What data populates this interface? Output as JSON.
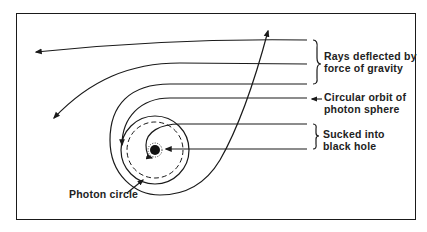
{
  "labels": {
    "rays_deflected_line1": "Rays deflected by",
    "rays_deflected_line2": "force of gravity",
    "circular_orbit_line1": "Circular orbit of",
    "circular_orbit_line2": "photon sphere",
    "sucked_line1": "Sucked into",
    "sucked_line2": "black hole",
    "photon_circle": "Photon circle"
  },
  "colors": {
    "stroke": "#1a1a1a",
    "background": "#ffffff"
  }
}
